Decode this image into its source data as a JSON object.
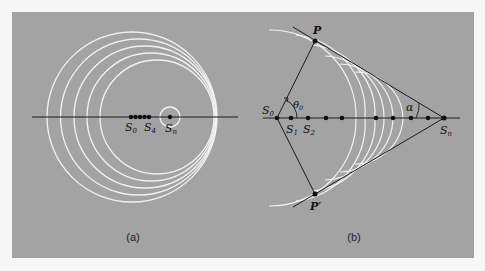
{
  "figure": {
    "panel_a": {
      "caption": "(a)",
      "labels": {
        "s0": "S",
        "s0_sub": "0",
        "s4": "S",
        "s4_sub": "4",
        "sn": "S",
        "sn_sub": "n"
      },
      "circles": [
        {
          "cx": 132,
          "cy": 117,
          "r": 85
        },
        {
          "cx": 138.5,
          "cy": 117,
          "r": 78
        },
        {
          "cx": 145,
          "cy": 117,
          "r": 71
        },
        {
          "cx": 151,
          "cy": 117,
          "r": 64
        },
        {
          "cx": 157,
          "cy": 117,
          "r": 57
        },
        {
          "cx": 170,
          "cy": 117,
          "r": 10
        }
      ],
      "sources_x": [
        131,
        135.5,
        140,
        144.5,
        149
      ],
      "sn_x": 170
    },
    "panel_b": {
      "caption": "(b)",
      "labels": {
        "p": "P",
        "p_prime": "P′",
        "s0": "S",
        "s0_sub": "0",
        "s1": "S",
        "s1_sub": "1",
        "s2": "S",
        "s2_sub": "2",
        "sn": "S",
        "sn_sub": "n",
        "theta": "θ",
        "theta_sub": "0",
        "alpha": "α"
      },
      "sources_x": [
        277,
        291,
        308,
        326,
        342,
        376,
        393,
        411,
        428
      ],
      "sn_x": 444,
      "p": [
        315,
        41
      ],
      "p_prime": [
        315,
        194
      ]
    },
    "colors": {
      "background": "#a3a3a3",
      "wavefront": "#f2f2f2",
      "line": "#1a1a1a"
    }
  }
}
